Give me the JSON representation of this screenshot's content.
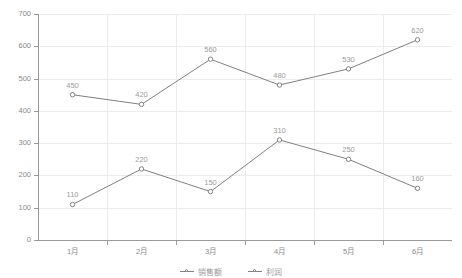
{
  "chart_data": {
    "type": "line",
    "title": "",
    "xlabel": "",
    "ylabel": "",
    "categories": [
      "1月",
      "2月",
      "3月",
      "4月",
      "5月",
      "6月"
    ],
    "series": [
      {
        "name": "销售额",
        "values": [
          450,
          420,
          560,
          480,
          530,
          620
        ],
        "color": "#808080"
      },
      {
        "name": "利润",
        "values": [
          110,
          220,
          150,
          310,
          250,
          160
        ],
        "color": "#808080"
      }
    ],
    "ylim": [
      0,
      700
    ],
    "ytick_step": 100,
    "yticks": [
      0,
      100,
      200,
      300,
      400,
      500,
      600,
      700
    ],
    "ytick_labels": [
      "0",
      "100",
      "200",
      "300",
      "400",
      "500",
      "600",
      "700"
    ],
    "grid": true,
    "grid_color": "#ececec",
    "axis_color": "#9a9a9a",
    "label_color": "#9b9b9b",
    "show_point_labels": true,
    "marker": "circle-open",
    "legend_position": "bottom"
  },
  "legend": {
    "entries": [
      {
        "label": "销售额"
      },
      {
        "label": "利润"
      }
    ]
  }
}
